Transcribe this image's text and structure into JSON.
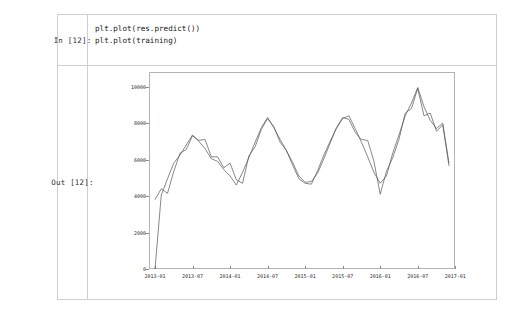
{
  "notebook": {
    "input_cell": {
      "prompt": "In [12]:",
      "code_lines": [
        "plt.plot(res.predict())",
        "plt.plot(training)"
      ]
    },
    "output_cell": {
      "prompt": "Out [12]:"
    }
  },
  "chart_data": {
    "type": "line",
    "title": "",
    "xlabel": "",
    "ylabel": "",
    "grid": false,
    "legend": null,
    "ylim": [
      0,
      10800
    ],
    "yticks": [
      0,
      2000,
      4000,
      6000,
      8000,
      10000
    ],
    "ytick_labels": [
      "0",
      "2000",
      "4000",
      "6000",
      "8000",
      "10000"
    ],
    "xlim": [
      "2012-12",
      "2017-02"
    ],
    "xticks": [
      "2013-01",
      "2013-07",
      "2014-01",
      "2014-07",
      "2015-01",
      "2015-07",
      "2016-01",
      "2016-07",
      "2017-01"
    ],
    "xtick_labels": [
      "2013-01",
      "2013-07",
      "2014-01",
      "2014-07",
      "2015-01",
      "2015-07",
      "2016-01",
      "2016-07",
      "2017-01"
    ],
    "colors": {
      "predict": "#555555",
      "training": "#555555"
    },
    "x": [
      "2013-01",
      "2013-02",
      "2013-03",
      "2013-04",
      "2013-05",
      "2013-06",
      "2013-07",
      "2013-08",
      "2013-09",
      "2013-10",
      "2013-11",
      "2013-12",
      "2014-01",
      "2014-02",
      "2014-03",
      "2014-04",
      "2014-05",
      "2014-06",
      "2014-07",
      "2014-08",
      "2014-09",
      "2014-10",
      "2014-11",
      "2014-12",
      "2015-01",
      "2015-02",
      "2015-03",
      "2015-04",
      "2015-05",
      "2015-06",
      "2015-07",
      "2015-08",
      "2015-09",
      "2015-10",
      "2015-11",
      "2015-12",
      "2016-01",
      "2016-02",
      "2016-03",
      "2016-04",
      "2016-05",
      "2016-06",
      "2016-07",
      "2016-08",
      "2016-09",
      "2016-10",
      "2016-11",
      "2016-12"
    ],
    "series": [
      {
        "name": "res.predict()",
        "values": [
          0,
          4050,
          4950,
          5800,
          6250,
          6800,
          7350,
          7000,
          6600,
          6050,
          5900,
          5450,
          5100,
          4600,
          5300,
          6100,
          6950,
          7750,
          8300,
          7750,
          7100,
          6500,
          5700,
          4950,
          4700,
          4650,
          5400,
          6250,
          7000,
          7700,
          8250,
          8400,
          7700,
          6950,
          6150,
          5300,
          4700,
          5100,
          6350,
          7350,
          8400,
          9100,
          9950,
          8900,
          8150,
          7700,
          8000,
          5800
        ]
      },
      {
        "name": "training",
        "values": [
          3800,
          4400,
          4150,
          5350,
          6350,
          6550,
          7300,
          7050,
          7100,
          6150,
          6150,
          5550,
          5800,
          4900,
          4700,
          6200,
          6700,
          7650,
          8250,
          7800,
          6950,
          6500,
          5850,
          5100,
          4750,
          4800,
          5250,
          6050,
          6900,
          7750,
          8300,
          8200,
          7500,
          7100,
          7050,
          5900,
          4100,
          5350,
          6100,
          7100,
          8550,
          8800,
          9900,
          8400,
          8550,
          7550,
          7900,
          5650
        ]
      }
    ]
  }
}
